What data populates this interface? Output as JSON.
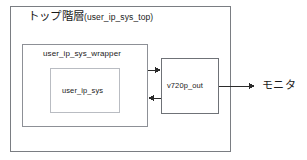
{
  "diagram": {
    "type": "block-diagram",
    "background_color": "#ffffff",
    "outer_block": {
      "label_jp": "トップ階層",
      "label_paren": "(user_ip_sys_top)",
      "border_color": "#7a7d82"
    },
    "blocks": [
      {
        "name": "user_ip_sys_wrapper",
        "label": "user_ip_sys_wrapper",
        "border_color": "#8d9096"
      },
      {
        "name": "user_ip_sys",
        "label": "user_ip_sys",
        "border_color": "#b9bcc2"
      },
      {
        "name": "v720p_out",
        "label": "v720p_out",
        "border_color": "#6f7277"
      }
    ],
    "external": {
      "monitor_label": "モニタ"
    },
    "connections": [
      {
        "name": "wrapper-to-v720p",
        "from": "user_ip_sys_wrapper",
        "to": "v720p_out",
        "direction": "right"
      },
      {
        "name": "v720p-to-wrapper",
        "from": "v720p_out",
        "to": "user_ip_sys_wrapper",
        "direction": "left"
      },
      {
        "name": "v720p-to-monitor",
        "from": "v720p_out",
        "to": "モニタ",
        "direction": "right"
      }
    ]
  }
}
